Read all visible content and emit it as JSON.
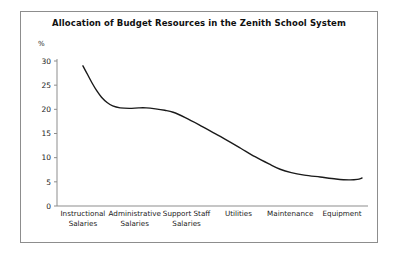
{
  "chart_data": {
    "type": "line",
    "title": "Allocation of Budget Resources in the Zenith School System",
    "xlabel": "",
    "ylabel": "%",
    "ylim": [
      0,
      30
    ],
    "yticks": [
      0,
      5,
      10,
      15,
      20,
      25,
      30
    ],
    "ytick_labels": [
      "0",
      "5",
      "10",
      "15",
      "20",
      "25",
      "30"
    ],
    "grid": false,
    "legend": false,
    "categories": [
      "Instructional Salaries",
      "Administrative Salaries",
      "Support Staff Salaries",
      "Utilities",
      "Maintenance",
      "Equipment"
    ],
    "category_lines": [
      [
        "Instructional",
        "Salaries"
      ],
      [
        "Administrative",
        "Salaries"
      ],
      [
        "Support Staff",
        "Salaries"
      ],
      [
        "Utilities",
        ""
      ],
      [
        "Maintenance",
        ""
      ],
      [
        "Equipment",
        ""
      ]
    ],
    "values": [
      29,
      20.2,
      20.3,
      17,
      7.5,
      5.8
    ],
    "series": [
      {
        "name": "Budget share",
        "values": [
          29,
          20.2,
          20.3,
          17,
          7.5,
          5.8
        ]
      }
    ],
    "curve_points": [
      [
        0.0,
        29.0
      ],
      [
        0.05,
        27.2
      ],
      [
        0.1,
        25.4
      ],
      [
        0.15,
        23.8
      ],
      [
        0.2,
        22.5
      ],
      [
        0.26,
        21.4
      ],
      [
        0.32,
        20.7
      ],
      [
        0.4,
        20.3
      ],
      [
        0.5,
        20.2
      ],
      [
        0.6,
        20.3
      ],
      [
        0.68,
        20.3
      ],
      [
        0.78,
        20.1
      ],
      [
        0.88,
        19.8
      ],
      [
        0.97,
        19.4
      ],
      [
        1.1,
        18.3
      ],
      [
        1.25,
        16.8
      ],
      [
        1.4,
        15.2
      ],
      [
        1.55,
        13.6
      ],
      [
        1.7,
        11.9
      ],
      [
        1.85,
        10.2
      ],
      [
        2.0,
        8.7
      ],
      [
        2.12,
        7.6
      ],
      [
        2.24,
        6.9
      ],
      [
        2.38,
        6.4
      ],
      [
        2.55,
        6.0
      ],
      [
        2.72,
        5.6
      ],
      [
        2.86,
        5.4
      ],
      [
        2.95,
        5.5
      ],
      [
        3.0,
        5.8
      ]
    ],
    "line_color": "#1a1a1a",
    "axis_color": "#8d8d8d",
    "frame_color": "#8d8d8d",
    "background_color": "#ffffff"
  }
}
